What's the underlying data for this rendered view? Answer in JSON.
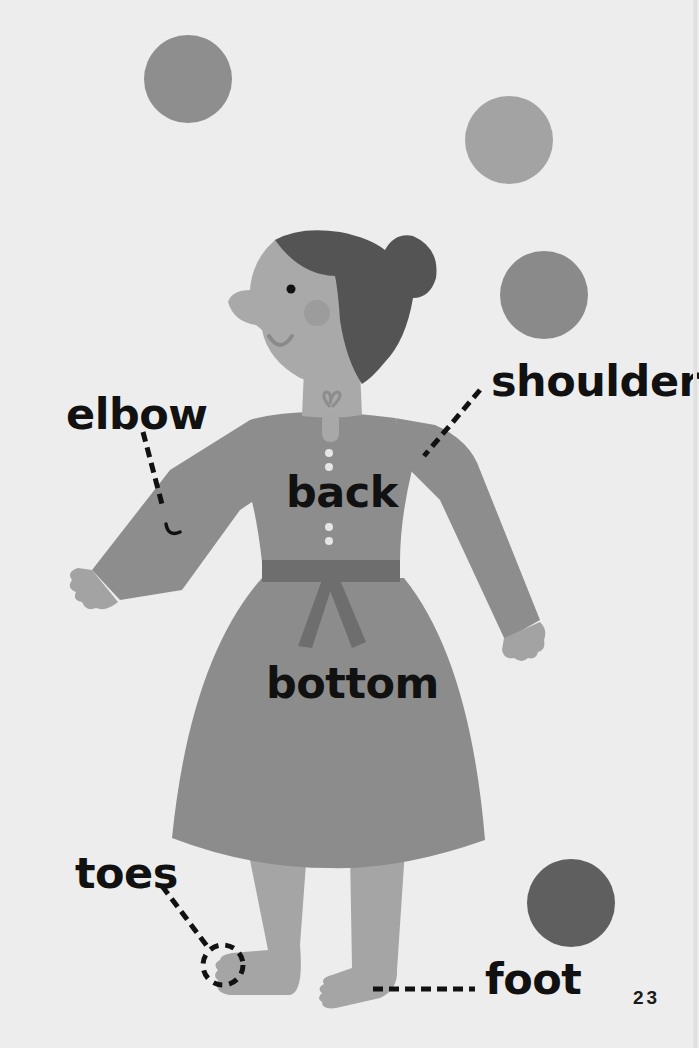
{
  "page": {
    "number": "23",
    "background_color": "#ededed"
  },
  "labels": {
    "elbow": "elbow",
    "shoulder": "shoulder",
    "back": "back",
    "bottom": "bottom",
    "toes": "toes",
    "foot": "foot"
  },
  "colors": {
    "ball_1": "#8e8e8e",
    "ball_2": "#a3a3a3",
    "ball_3": "#8a8a8a",
    "ball_4": "#5f5f5f",
    "skin": "#a9a9a9",
    "hair": "#545454",
    "dress": "#8c8c8c",
    "belt": "#6e6e6e",
    "text": "#111111"
  },
  "illustration": {
    "subject": "woman-in-dress-juggling",
    "balls_count": 4
  }
}
